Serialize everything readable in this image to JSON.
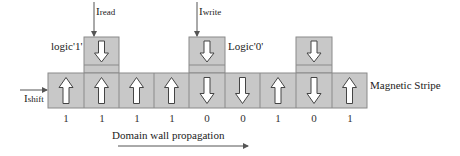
{
  "diagram": {
    "labels": {
      "logic1": "logic'1'",
      "logic0": "Logic'0'",
      "read_current": "I",
      "read_current_sub": "read",
      "write_current": "I",
      "write_current_sub": "write",
      "shift_current": "I",
      "shift_current_sub": "shift",
      "stripe": "Magnetic Stripe",
      "propagation": "Domain wall propagation"
    },
    "stripe_cells": [
      {
        "direction": "up",
        "bit": "1"
      },
      {
        "direction": "up",
        "bit": "1"
      },
      {
        "direction": "up",
        "bit": "1"
      },
      {
        "direction": "up",
        "bit": "1"
      },
      {
        "direction": "down",
        "bit": "0"
      },
      {
        "direction": "down",
        "bit": "0"
      },
      {
        "direction": "up",
        "bit": "1"
      },
      {
        "direction": "down",
        "bit": "0"
      },
      {
        "direction": "up",
        "bit": "1"
      }
    ],
    "upper_boxes": [
      {
        "over_cell": 1,
        "direction": "down",
        "role": "read"
      },
      {
        "over_cell": 4,
        "direction": "down",
        "role": "write"
      },
      {
        "over_cell": 7,
        "direction": "down",
        "role": "reference"
      }
    ],
    "colors": {
      "cell_fill": "#c8c8c8",
      "cell_border": "#8a8a8a",
      "arrow_stroke": "#444444",
      "arrow_fill": "#ffffff"
    }
  }
}
